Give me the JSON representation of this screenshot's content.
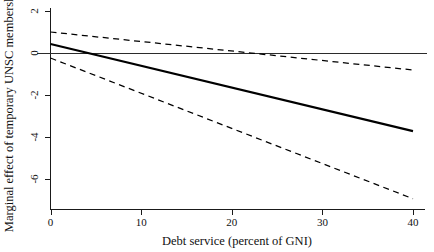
{
  "chart_data": {
    "type": "line",
    "title": "",
    "xlabel": "Debt service (percent of GNI)",
    "ylabel": "Marginal effect of temporary UNSC membership",
    "xlim": [
      -1.5,
      41.5
    ],
    "ylim": [
      -7.4,
      2.6
    ],
    "xticks": [
      0,
      10,
      20,
      30,
      40
    ],
    "xtick_labels": [
      "0",
      "10",
      "20",
      "30",
      "40"
    ],
    "yticks": [
      2,
      0,
      -2,
      -4,
      -6
    ],
    "ytick_labels": [
      "2",
      "0",
      "-2",
      "-4",
      "-6"
    ],
    "grid": false,
    "legend": null,
    "annotations": [],
    "series": [
      {
        "name": "Zero reference line",
        "style": "solid-thin",
        "x": [
          -1.5,
          41.5
        ],
        "values": [
          0,
          0
        ]
      },
      {
        "name": "Marginal effect (point estimate)",
        "style": "solid-thick",
        "x": [
          0,
          40
        ],
        "values": [
          0.43,
          -3.72
        ]
      },
      {
        "name": "Upper 95% confidence bound",
        "style": "dashed",
        "x": [
          0,
          40
        ],
        "values": [
          1.0,
          -0.81
        ]
      },
      {
        "name": "Lower 95% confidence bound",
        "style": "dashed",
        "x": [
          0,
          40
        ],
        "values": [
          -0.24,
          -6.94
        ]
      }
    ]
  }
}
